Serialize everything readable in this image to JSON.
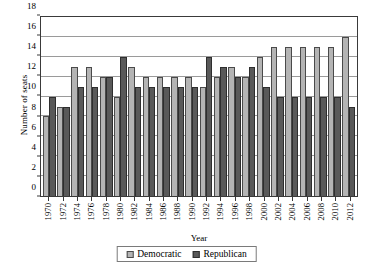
{
  "chart_data": {
    "type": "bar",
    "title": "",
    "xlabel": "Year",
    "ylabel": "Number of seats",
    "ylim": [
      0,
      18
    ],
    "ytick_step": 2,
    "yticks": [
      0,
      2,
      4,
      6,
      8,
      10,
      12,
      14,
      16,
      18
    ],
    "grid": "horizontal",
    "legend_position": "bottom-center",
    "categories": [
      "1970",
      "1972",
      "1974",
      "1976",
      "1978",
      "1980",
      "1982",
      "1984",
      "1986",
      "1988",
      "1990",
      "1992",
      "1994",
      "1996",
      "1998",
      "2000",
      "2002",
      "2004",
      "2006",
      "2008",
      "2010",
      "2012"
    ],
    "series": [
      {
        "name": "Democratic",
        "color": "#b4b4b4",
        "values": [
          8,
          9,
          13,
          13,
          12,
          10,
          13,
          12,
          12,
          12,
          12,
          11,
          12,
          13,
          12,
          14,
          15,
          15,
          15,
          15,
          15,
          16
        ]
      },
      {
        "name": "Republican",
        "color": "#595959",
        "values": [
          10,
          9,
          11,
          11,
          12,
          14,
          11,
          11,
          11,
          11,
          11,
          14,
          13,
          12,
          13,
          11,
          10,
          10,
          10,
          10,
          10,
          9
        ]
      }
    ]
  },
  "legend": {
    "items": [
      {
        "label": "Democratic",
        "swatch": "dem"
      },
      {
        "label": "Republican",
        "swatch": "rep"
      }
    ]
  },
  "caption": {
    "text": ""
  }
}
